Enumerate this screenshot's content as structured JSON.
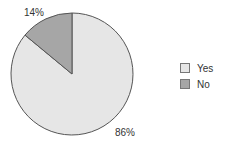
{
  "chart_data": {
    "type": "pie",
    "title": "",
    "categories": [
      "Yes",
      "No"
    ],
    "values": [
      86,
      14
    ],
    "labels": [
      "86%",
      "14%"
    ],
    "colors": [
      "#e6e6e6",
      "#a6a6a6"
    ],
    "legend_position": "right"
  },
  "legend": {
    "items": [
      {
        "label": "Yes",
        "color": "#e6e6e6"
      },
      {
        "label": "No",
        "color": "#a6a6a6"
      }
    ]
  }
}
